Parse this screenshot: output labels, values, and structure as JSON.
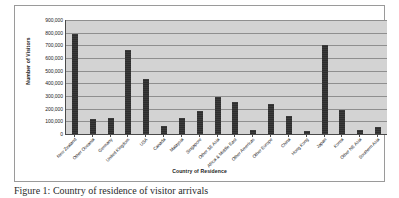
{
  "figure": {
    "caption": "Figure 1: Country of residence of visitor arrivals"
  },
  "chart_data": {
    "type": "bar",
    "title": "",
    "xlabel": "Country of Residence",
    "ylabel": "Number of Visitors",
    "ylim": [
      0,
      900000
    ],
    "ytick_values": [
      900000,
      800000,
      700000,
      600000,
      500000,
      400000,
      300000,
      200000,
      100000,
      0
    ],
    "ytick_labels": [
      "900,000",
      "800,000",
      "700,000",
      "600,000",
      "500,000",
      "400,000",
      "300,000",
      "200,000",
      "100,000",
      "0"
    ],
    "grid": true,
    "legend": false,
    "bar_color": "#3a3a3a",
    "plot_background": "#d3d3d3",
    "categories": [
      "New Zealand",
      "Other Oceania",
      "Germany",
      "United Kingdom",
      "USA",
      "Canada",
      "Malaysia",
      "Singapore",
      "Other SE Asia",
      "Africa & Middle East",
      "Other Americas",
      "Other Europe",
      "China",
      "Hong Kong",
      "Japan",
      "Korea",
      "Other NE Asia",
      "Southern Asia"
    ],
    "values": [
      790000,
      120000,
      130000,
      660000,
      435000,
      60000,
      125000,
      180000,
      290000,
      250000,
      30000,
      235000,
      145000,
      20000,
      700000,
      190000,
      30000,
      55000
    ]
  }
}
